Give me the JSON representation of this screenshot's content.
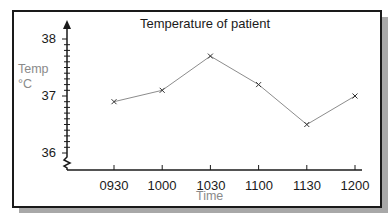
{
  "chart_data": {
    "type": "line",
    "title": "Temperature of patient",
    "xlabel": "Time",
    "ylabel": "Temp °C",
    "ylabel_lines": [
      "Temp",
      "°C"
    ],
    "categories": [
      "0930",
      "1000",
      "1030",
      "1100",
      "1130",
      "1200"
    ],
    "series": [
      {
        "name": "Temperature",
        "values": [
          36.9,
          37.1,
          37.7,
          37.2,
          36.5,
          37.0
        ],
        "marker": "x",
        "color": "#8c8c8c"
      }
    ],
    "yticks": [
      "38",
      "37",
      "36"
    ],
    "ylim": [
      36,
      38
    ],
    "y_minor_step": 0.1,
    "y_axis_break": true,
    "grid": false,
    "legend": "none"
  }
}
